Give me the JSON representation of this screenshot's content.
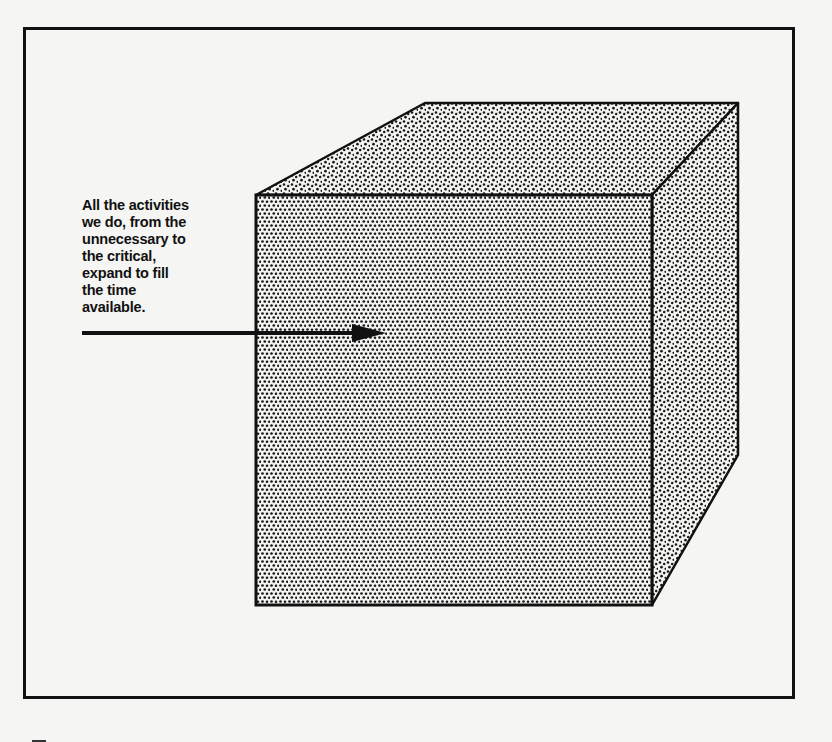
{
  "figure": {
    "caption_lines": [
      "All the activities",
      "we do, from the",
      "unnecessary to",
      "the critical,",
      "expand to fill",
      "the time",
      "available."
    ],
    "colors": {
      "ink": "#111111",
      "paper": "#f5f5f3",
      "stipple_dot": "#1a1a1a"
    },
    "shape": "stippled-cube",
    "pointer": "arrow-right"
  }
}
